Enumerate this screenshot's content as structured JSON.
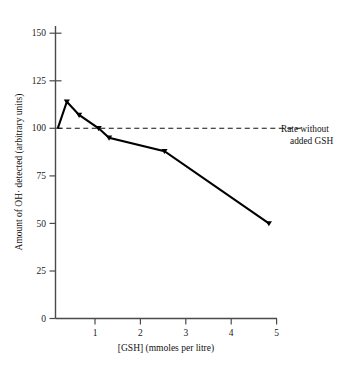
{
  "chart_data": {
    "type": "line",
    "title": "",
    "subtitle": "",
    "xlabel": "[GSH] (mmoles per litre)",
    "ylabel": "Amount of OH· detected (arbitrary units)",
    "xlim": [
      0,
      5
    ],
    "ylim": [
      0,
      160
    ],
    "grid": false,
    "legend": "none",
    "x_ticks": [
      "1",
      "2",
      "3",
      "4",
      "5"
    ],
    "x_tick_values": [
      1,
      2,
      3,
      4,
      5
    ],
    "y_ticks": [
      "0",
      "25",
      "50",
      "75",
      "100",
      "125",
      "150"
    ],
    "y_tick_values": [
      0,
      25,
      50,
      75,
      100,
      125,
      150
    ],
    "series": [
      {
        "name": "Amount of OH· detected",
        "marker": "triangle",
        "points": [
          {
            "x": 0.05,
            "y": 100
          },
          {
            "x": 0.25,
            "y": 114
          },
          {
            "x": 0.52,
            "y": 107
          },
          {
            "x": 0.95,
            "y": 100
          },
          {
            "x": 1.18,
            "y": 95
          },
          {
            "x": 2.4,
            "y": 88
          },
          {
            "x": 4.7,
            "y": 50
          }
        ]
      }
    ],
    "reference_line": {
      "name": "rate-without-added-gsh",
      "value": 100,
      "style": "dashed",
      "x_start": 0.05,
      "x_end": 5.45
    },
    "annotations": [
      {
        "name": "reference-line-annotation",
        "line1": "Rate without",
        "line2": "added GSH"
      }
    ]
  }
}
